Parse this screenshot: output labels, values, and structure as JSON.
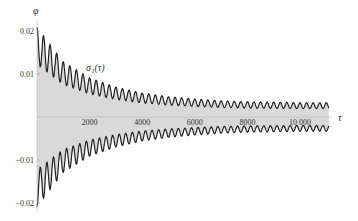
{
  "chart_data": {
    "type": "line",
    "title": "",
    "xlabel": "τ",
    "ylabel": "φ",
    "curve_label": "σ₁(τ)",
    "xlim": [
      0,
      11500
    ],
    "ylim": [
      -0.022,
      0.022
    ],
    "x_ticks": [
      2000,
      4000,
      6000,
      8000,
      10000
    ],
    "x_tick_labels": [
      "2000",
      "4000",
      "6000",
      "8000",
      "10 000"
    ],
    "y_ticks": [
      0.02,
      0.01,
      -0.01,
      -0.02
    ],
    "y_tick_labels": [
      "0.02",
      "0.01",
      "−0.01",
      "−0.02"
    ],
    "grid": false,
    "legend": "none",
    "series": [
      {
        "name": "upper envelope σ₁(τ)",
        "description": "damped oscillation decaying from ~0.02 toward ~0.003",
        "x": [
          0,
          1000,
          2000,
          3000,
          4000,
          5000,
          6000,
          7000,
          8000,
          9000,
          10000,
          11000
        ],
        "values": [
          0.0195,
          0.012,
          0.0085,
          0.0065,
          0.0052,
          0.0044,
          0.0039,
          0.0035,
          0.0033,
          0.0032,
          0.0031,
          0.0031
        ]
      },
      {
        "name": "lower envelope",
        "x": [
          0,
          1000,
          2000,
          3000,
          4000,
          5000,
          6000,
          7000,
          8000,
          9000,
          10000,
          11000
        ],
        "values": [
          -0.0195,
          -0.012,
          -0.0085,
          -0.0065,
          -0.0052,
          -0.0044,
          -0.0039,
          -0.0035,
          -0.0033,
          -0.0032,
          -0.0031,
          -0.0031
        ]
      }
    ],
    "fill": "gray band between upper and lower curves",
    "colors": {
      "fill": "#d9d9d9",
      "curve": "#222222"
    }
  }
}
